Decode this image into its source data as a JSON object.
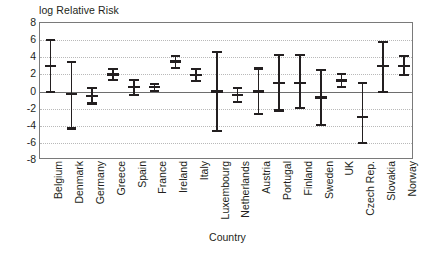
{
  "chart_data": {
    "type": "errorbar",
    "title": "log Relative Risk",
    "xlabel": "Country",
    "ylabel": "",
    "ylim": [
      -8,
      8
    ],
    "yticks": [
      8,
      6,
      4,
      2,
      0,
      -2,
      -4,
      -6,
      -8
    ],
    "grid": true,
    "legend": "none",
    "zero_reference_line": 0,
    "categories": [
      "Belgium",
      "Denmark",
      "Germany",
      "Greece",
      "Spain",
      "France",
      "Ireland",
      "Italy",
      "Luxembourg",
      "Netherlands",
      "Austria",
      "Portugal",
      "Finland",
      "Sweden",
      "UK",
      "Czech Rep.",
      "Slovakia",
      "Norway"
    ],
    "series": [
      {
        "name": "log Relative Risk",
        "estimates": [
          3.0,
          -0.3,
          -0.5,
          2.0,
          0.5,
          0.5,
          3.5,
          1.9,
          0.0,
          -0.4,
          0.0,
          1.0,
          1.0,
          -0.7,
          1.3,
          -3.0,
          3.0,
          3.0
        ],
        "lower": [
          0.0,
          -4.3,
          -1.4,
          1.4,
          -0.4,
          0.1,
          2.8,
          1.2,
          -4.6,
          -1.2,
          -2.6,
          -2.2,
          -1.9,
          -3.9,
          0.5,
          -6.0,
          0.0,
          1.9
        ],
        "upper": [
          6.0,
          3.5,
          0.4,
          2.6,
          1.4,
          0.9,
          4.2,
          2.6,
          4.6,
          0.4,
          2.7,
          4.3,
          4.3,
          2.5,
          2.1,
          1.0,
          5.8,
          4.2
        ]
      }
    ],
    "points": [
      {
        "country": "Belgium",
        "estimate": 3.0,
        "lower": 0.0,
        "upper": 6.0
      },
      {
        "country": "Denmark",
        "estimate": -0.3,
        "lower": -4.3,
        "upper": 3.5
      },
      {
        "country": "Germany",
        "estimate": -0.5,
        "lower": -1.4,
        "upper": 0.4
      },
      {
        "country": "Greece",
        "estimate": 2.0,
        "lower": 1.4,
        "upper": 2.6
      },
      {
        "country": "Spain",
        "estimate": 0.5,
        "lower": -0.4,
        "upper": 1.4
      },
      {
        "country": "France",
        "estimate": 0.5,
        "lower": 0.1,
        "upper": 0.9
      },
      {
        "country": "Ireland",
        "estimate": 3.5,
        "lower": 2.8,
        "upper": 4.2
      },
      {
        "country": "Italy",
        "estimate": 1.9,
        "lower": 1.2,
        "upper": 2.6
      },
      {
        "country": "Luxembourg",
        "estimate": 0.0,
        "lower": -4.6,
        "upper": 4.6
      },
      {
        "country": "Netherlands",
        "estimate": -0.4,
        "lower": -1.2,
        "upper": 0.4
      },
      {
        "country": "Austria",
        "estimate": 0.0,
        "lower": -2.6,
        "upper": 2.7
      },
      {
        "country": "Portugal",
        "estimate": 1.0,
        "lower": -2.2,
        "upper": 4.3
      },
      {
        "country": "Finland",
        "estimate": 1.0,
        "lower": -1.9,
        "upper": 4.3
      },
      {
        "country": "Sweden",
        "estimate": -0.7,
        "lower": -3.9,
        "upper": 2.5
      },
      {
        "country": "UK",
        "estimate": 1.3,
        "lower": 0.5,
        "upper": 2.1
      },
      {
        "country": "Czech Rep.",
        "estimate": -3.0,
        "lower": -6.0,
        "upper": 1.0
      },
      {
        "country": "Slovakia",
        "estimate": 3.0,
        "lower": 0.0,
        "upper": 5.8
      },
      {
        "country": "Norway",
        "estimate": 3.0,
        "lower": 1.9,
        "upper": 4.2
      }
    ],
    "colors": {
      "marker": "#231f20",
      "axis": "#7a7a7a",
      "gridline": "#b9b9b9",
      "zeroline": "#6e6e6e",
      "background": "#ffffff"
    }
  }
}
